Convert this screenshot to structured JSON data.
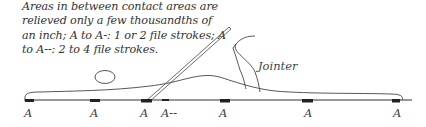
{
  "caption": {
    "lines": [
      "Areas in between contact areas are",
      "relieved only a few thousandths of",
      "an inch; A to A-: 1 or 2 file strokes; A",
      "to A--: 2 to 4 file strokes."
    ]
  },
  "tool_label": "Jointer",
  "contact_labels": [
    "A",
    "A",
    "A",
    "A--",
    "A",
    "A",
    "A"
  ],
  "colors": {
    "ink": "#333333",
    "pad": "#222222"
  }
}
